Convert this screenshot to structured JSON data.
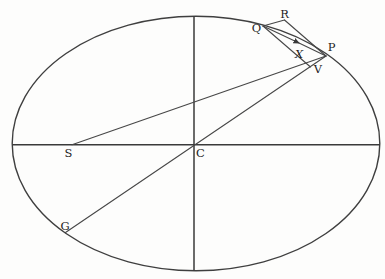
{
  "figure": {
    "background": "#fdfdfc",
    "stroke_color": "#3f3f3f",
    "labels": {
      "R": "R",
      "Q": "Q",
      "P": "P",
      "X": "X",
      "V": "V",
      "S": "S",
      "C": "C",
      "G": "G"
    },
    "geometry": {
      "ellipse": {
        "cx": 196,
        "cy": 143.5,
        "rx": 184,
        "ry": 127
      },
      "points": {
        "C": [
          196,
          144
        ],
        "S": [
          72,
          145
        ],
        "G": [
          65,
          232
        ],
        "P": [
          326,
          56
        ],
        "Q": [
          263,
          26
        ],
        "R": [
          284,
          20
        ],
        "X": [
          306,
          64
        ],
        "V": [
          310,
          67
        ]
      },
      "lines": [
        {
          "name": "major-axis",
          "from": [
            12,
            144.8
          ],
          "to": [
            380,
            144.8
          ]
        },
        {
          "name": "minor-axis",
          "from": [
            194,
            16
          ],
          "to": [
            194,
            270.5
          ]
        },
        {
          "name": "diameter-GCP",
          "from": [
            65.5,
            232.5
          ],
          "to": [
            326,
            56
          ]
        },
        {
          "name": "focal-line-SP",
          "from": [
            72,
            144.8
          ],
          "to": [
            326,
            56
          ]
        },
        {
          "name": "segment-QR",
          "from": [
            263,
            26
          ],
          "to": [
            284.5,
            20
          ]
        },
        {
          "name": "segment-RP",
          "from": [
            284.5,
            20
          ],
          "to": [
            326,
            56
          ]
        },
        {
          "name": "chord-QP-with-arrow",
          "from": [
            263,
            26
          ],
          "to": [
            326,
            56
          ]
        },
        {
          "name": "ordinate-QXV",
          "from": [
            263,
            26
          ],
          "to": [
            310.5,
            67
          ]
        }
      ],
      "arrow_on_chord_QP_at": [
        299,
        43
      ]
    }
  }
}
